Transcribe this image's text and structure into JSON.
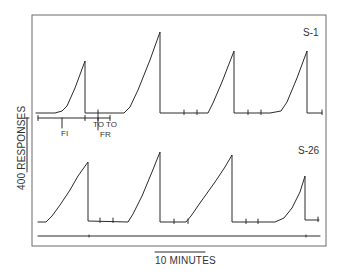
{
  "chart_data": {
    "type": "line",
    "title": "",
    "subtype": "cumulative-record",
    "frame": {
      "x0": 32,
      "y0": 15,
      "x1": 326,
      "y1": 246
    },
    "scale_bars": {
      "y": {
        "label": "400 RESPONSES",
        "value": 400,
        "unit": "responses",
        "x": 27,
        "y_top": 118,
        "y_bottom": 172
      },
      "x": {
        "label": "10 MINUTES",
        "value": 10,
        "unit": "minutes",
        "x_left": 155,
        "x_right": 205,
        "y": 252
      }
    },
    "annotations": [
      {
        "text": "FI",
        "x": 61,
        "y": 136,
        "tick_x": 62,
        "tick_y0": 118,
        "tick_y1": 128
      },
      {
        "text": "TO",
        "x": 93,
        "y": 127
      },
      {
        "text": "TO",
        "x": 106,
        "y": 127
      },
      {
        "text": "FR",
        "x": 100,
        "y": 137
      }
    ],
    "series": [
      {
        "name": "S-1",
        "label_pos": {
          "x": 303,
          "y": 36
        },
        "baseline": 113,
        "bracket": {
          "y": 118,
          "segments": [
            [
              38,
              85
            ],
            [
              85,
              98
            ],
            [
              98,
              110
            ]
          ]
        },
        "points": [
          [
            36,
            113
          ],
          [
            55,
            113
          ],
          [
            62,
            111
          ],
          [
            67,
            106
          ],
          [
            75,
            88
          ],
          [
            85,
            61
          ],
          [
            85,
            113
          ],
          [
            110,
            113
          ],
          [
            124,
            113
          ],
          [
            130,
            107
          ],
          [
            138,
            90
          ],
          [
            150,
            60
          ],
          [
            160,
            32
          ],
          [
            160,
            113
          ],
          [
            185,
            113
          ],
          [
            208,
            113
          ],
          [
            213,
            103
          ],
          [
            222,
            82
          ],
          [
            234,
            51
          ],
          [
            234,
            113
          ],
          [
            253,
            113
          ],
          [
            270,
            113
          ],
          [
            281,
            111
          ],
          [
            287,
            102
          ],
          [
            297,
            78
          ],
          [
            307,
            51
          ],
          [
            307,
            113
          ],
          [
            322,
            113
          ]
        ],
        "event_ticks": [
          [
            98,
            113
          ],
          [
            184,
            113
          ],
          [
            197,
            113
          ],
          [
            248,
            113
          ],
          [
            261,
            113
          ],
          [
            322,
            113
          ]
        ],
        "cycles": [
          {
            "peak_x": 85,
            "peak_y": 61
          },
          {
            "peak_x": 160,
            "peak_y": 32
          },
          {
            "peak_x": 234,
            "peak_y": 51
          },
          {
            "peak_x": 307,
            "peak_y": 51
          }
        ]
      },
      {
        "name": "S-26",
        "label_pos": {
          "x": 298,
          "y": 154
        },
        "baseline": 222,
        "points": [
          [
            38,
            222
          ],
          [
            46,
            222
          ],
          [
            52,
            216
          ],
          [
            60,
            205
          ],
          [
            70,
            190
          ],
          [
            78,
            176
          ],
          [
            88,
            162
          ],
          [
            88,
            221
          ],
          [
            128,
            222
          ],
          [
            133,
            214
          ],
          [
            142,
            196
          ],
          [
            152,
            172
          ],
          [
            160,
            152
          ],
          [
            160,
            222
          ],
          [
            186,
            222
          ],
          [
            191,
            216
          ],
          [
            200,
            203
          ],
          [
            215,
            182
          ],
          [
            225,
            167
          ],
          [
            232,
            155
          ],
          [
            232,
            222
          ],
          [
            260,
            222
          ],
          [
            275,
            222
          ],
          [
            284,
            218
          ],
          [
            292,
            208
          ],
          [
            300,
            192
          ],
          [
            305,
            176
          ],
          [
            305,
            220
          ],
          [
            319,
            220
          ]
        ],
        "event_ticks": [
          [
            100,
            221
          ],
          [
            113,
            221
          ],
          [
            174,
            222
          ],
          [
            188,
            222
          ],
          [
            246,
            222
          ],
          [
            258,
            222
          ],
          [
            318,
            220
          ]
        ],
        "cycles": [
          {
            "peak_x": 88,
            "peak_y": 162
          },
          {
            "peak_x": 160,
            "peak_y": 152
          },
          {
            "peak_x": 232,
            "peak_y": 155
          },
          {
            "peak_x": 305,
            "peak_y": 176
          }
        ]
      }
    ],
    "event_line": {
      "y": 236,
      "x0": 38,
      "x1": 320,
      "ticks": [
        89,
        306
      ]
    }
  }
}
